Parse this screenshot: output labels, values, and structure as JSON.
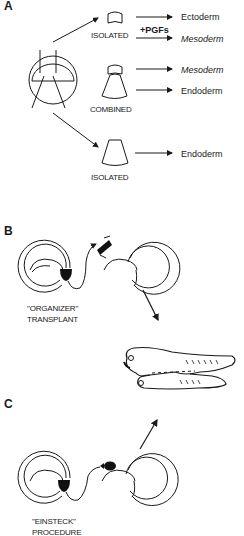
{
  "panels": {
    "a": {
      "label": "A",
      "isolated_top": {
        "caption": "ISOLATED",
        "outputs": [
          {
            "text": "Ectoderm",
            "italic": false
          },
          {
            "text": "Mesoderm",
            "italic": true
          }
        ],
        "treatment": "+PGFs"
      },
      "combined": {
        "caption": "COMBINED",
        "outputs": [
          {
            "text": "Mesoderm",
            "italic": true
          },
          {
            "text": "Endoderm",
            "italic": false
          }
        ]
      },
      "isolated_bottom": {
        "caption": "ISOLATED",
        "outputs": [
          {
            "text": "Endoderm",
            "italic": false
          }
        ]
      }
    },
    "b": {
      "label": "B",
      "caption_line1": "\"ORGANIZER\"",
      "caption_line2": "TRANSPLANT"
    },
    "c": {
      "label": "C",
      "caption_line1": "\"EINSTECK\"",
      "caption_line2": "PROCEDURE"
    }
  },
  "result": {
    "description": "twinned embryo (secondary axis)"
  }
}
